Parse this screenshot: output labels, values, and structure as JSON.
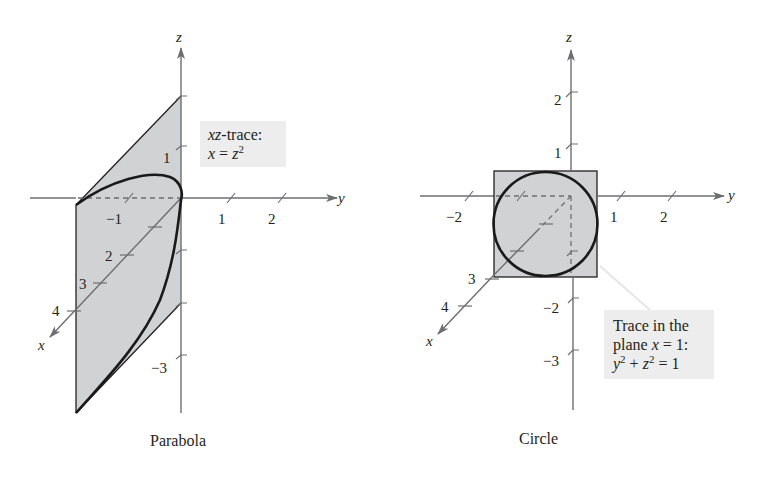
{
  "figures": [
    {
      "id": "parabola",
      "caption": "Parabola",
      "callout": {
        "line1_italic": "xz",
        "line1_rest": "-trace:",
        "line2_var": "x",
        "line2_eq": " = ",
        "line2_var2": "z",
        "line2_exp": "2"
      },
      "axis_labels": {
        "x": "x",
        "y": "y",
        "z": "z"
      },
      "y_ticks": [
        "−1",
        "1",
        "2"
      ],
      "z_ticks": [
        "1",
        "−3"
      ],
      "x_ticks": [
        "2",
        "3",
        "4"
      ]
    },
    {
      "id": "circle",
      "caption": "Circle",
      "callout": {
        "line1": "Trace in the",
        "line2_pre": "plane ",
        "line2_var": "x",
        "line2_post": " = 1:",
        "line3_y": "y",
        "line3_plus": " + ",
        "line3_z": "z",
        "line3_eq": " = 1",
        "exp": "2"
      },
      "axis_labels": {
        "x": "x",
        "y": "y",
        "z": "z"
      },
      "y_ticks": [
        "−2",
        "1",
        "2"
      ],
      "z_ticks": [
        "2",
        "1",
        "−2",
        "−3"
      ],
      "x_ticks": [
        "3",
        "4"
      ]
    }
  ],
  "colors": {
    "axis": "#6d6e71",
    "plane_fill": "#d1d2d4",
    "curve": "#1a1a1a",
    "callout_bg": "#ededed"
  }
}
